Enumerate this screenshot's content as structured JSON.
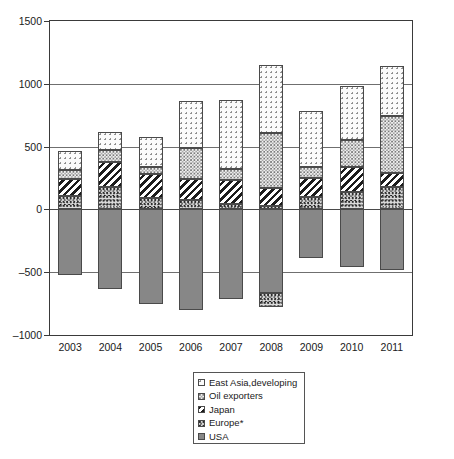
{
  "chart_data": {
    "type": "bar",
    "subtype": "stacked-bar-with-negatives",
    "title": "",
    "subtitle": "",
    "xlabel": "",
    "ylabel": "",
    "categories": [
      "2003",
      "2004",
      "2005",
      "2006",
      "2007",
      "2008",
      "2009",
      "2010",
      "2011"
    ],
    "ylim": [
      -1000,
      1500
    ],
    "yticks": [
      -1000,
      -500,
      0,
      500,
      1000,
      1500
    ],
    "ytick_labels": [
      "–1000",
      "–500",
      "0",
      "500",
      "1000",
      "1500"
    ],
    "grid": true,
    "legend_position": "bottom-center",
    "series": [
      {
        "name": "East Asia,developing",
        "pattern": "light-dots",
        "color": "#fbfbfb",
        "values": [
          155,
          145,
          245,
          375,
          550,
          545,
          445,
          430,
          395
        ]
      },
      {
        "name": "Oil exporters",
        "pattern": "dense-dots",
        "color": "#f0f0f0",
        "values": [
          65,
          95,
          55,
          250,
          85,
          435,
          85,
          215,
          455
        ]
      },
      {
        "name": "Japan",
        "pattern": "diagonal-stripes",
        "color": "#1c1c1c",
        "values": [
          135,
          200,
          190,
          165,
          195,
          140,
          155,
          200,
          110
        ]
      },
      {
        "name": "Europe*",
        "pattern": "speckle",
        "color": "#dcdcdc",
        "values": [
          110,
          180,
          90,
          75,
          40,
          30,
          95,
          140,
          180
        ],
        "negative_values": [
          0,
          0,
          0,
          0,
          0,
          -110,
          0,
          0,
          0
        ]
      },
      {
        "name": "USA",
        "pattern": "solid-gray",
        "color": "#878787",
        "values": [
          -520,
          -630,
          -755,
          -805,
          -715,
          -665,
          -385,
          -455,
          -480
        ]
      }
    ]
  },
  "axes": {
    "y": {
      "ticks": [
        {
          "label": "1500",
          "value": 1500
        },
        {
          "label": "1000",
          "value": 1000
        },
        {
          "label": "500",
          "value": 500
        },
        {
          "label": "0",
          "value": 0
        },
        {
          "label": "–500",
          "value": -500
        },
        {
          "label": "–1000",
          "value": -1000
        }
      ]
    },
    "x": {
      "ticks": [
        {
          "label": "2003"
        },
        {
          "label": "2004"
        },
        {
          "label": "2005"
        },
        {
          "label": "2006"
        },
        {
          "label": "2007"
        },
        {
          "label": "2008"
        },
        {
          "label": "2009"
        },
        {
          "label": "2010"
        },
        {
          "label": "2011"
        }
      ]
    }
  },
  "legend": {
    "items": [
      {
        "label": "East Asia,developing",
        "swatch": "light-dots"
      },
      {
        "label": "Oil exporters",
        "swatch": "dense-dots"
      },
      {
        "label": "Japan",
        "swatch": "diagonal-stripes"
      },
      {
        "label": "Europe*",
        "swatch": "speckle"
      },
      {
        "label": "USA",
        "swatch": "solid-gray"
      }
    ]
  }
}
